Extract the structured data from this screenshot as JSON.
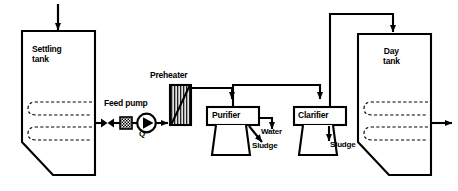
{
  "diagram": {
    "type": "process-flow",
    "background_color": "#ffffff",
    "line_color": "#000000",
    "nodes": {
      "settling_tank": {
        "label": "Settling\ntank",
        "label_line1": "Settling",
        "label_line2": "tank",
        "shape": "tank-chamfered-bottom-left",
        "has_heating_coil": true,
        "coil_style": "dashed-serpentine",
        "coil_loops": 2
      },
      "feed_pump": {
        "label": "Feed pump",
        "flow_label": "Q",
        "shape": "circle-with-triangle"
      },
      "valve": {
        "label": "",
        "shape": "bowtie"
      },
      "strainer": {
        "label": "",
        "shape": "hatched-square"
      },
      "preheater": {
        "label": "Preheater",
        "shape": "hatched-rectangle-with-diagonal"
      },
      "purifier": {
        "label": "Purifier",
        "shape": "box-with-bowl",
        "outputs": [
          {
            "label": "Water"
          },
          {
            "label": "Sludge"
          }
        ]
      },
      "clarifier": {
        "label": "Clarifier",
        "shape": "box-with-bowl",
        "outputs": [
          {
            "label": "Sludge"
          }
        ]
      },
      "day_tank": {
        "label": "Day\ntank",
        "label_line1": "Day",
        "label_line2": "tank",
        "shape": "tank-chamfered-bottom-left",
        "has_heating_coil": true,
        "coil_style": "dashed-serpentine",
        "coil_loops": 2
      }
    },
    "flows": {
      "inlet": {
        "label": "",
        "direction": "down",
        "target": "settling_tank"
      },
      "settling_to_pump": {
        "label": "",
        "direction": "right"
      },
      "pump_to_preheater": {
        "label": "",
        "direction": "right"
      },
      "preheater_to_purifier": {
        "label": "",
        "direction": "down"
      },
      "purifier_to_clarifier": {
        "label": "",
        "direction": "right"
      },
      "clarifier_to_day_tank": {
        "label": "",
        "direction": "right"
      },
      "outlet": {
        "label": "",
        "direction": "right",
        "source": "day_tank"
      }
    }
  }
}
